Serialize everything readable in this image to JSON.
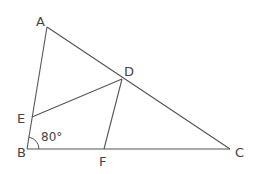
{
  "diagram": {
    "type": "geometry",
    "points": {
      "A": {
        "label": "A",
        "x": 47,
        "y": 27
      },
      "B": {
        "label": "B",
        "x": 27,
        "y": 149
      },
      "C": {
        "label": "C",
        "x": 230,
        "y": 149
      },
      "D": {
        "label": "D",
        "x": 122,
        "y": 79
      },
      "E": {
        "label": "E",
        "x": 32,
        "y": 117
      },
      "F": {
        "label": "F",
        "x": 104,
        "y": 149
      }
    },
    "segments": [
      {
        "from": "A",
        "to": "B"
      },
      {
        "from": "B",
        "to": "C"
      },
      {
        "from": "A",
        "to": "C"
      },
      {
        "from": "E",
        "to": "D"
      },
      {
        "from": "D",
        "to": "F"
      }
    ],
    "angle_marks": [
      {
        "vertex": "B",
        "label": "80°",
        "between": [
          "A",
          "C"
        ]
      }
    ],
    "stroke_color": "#555555",
    "label_color": "#444444"
  }
}
